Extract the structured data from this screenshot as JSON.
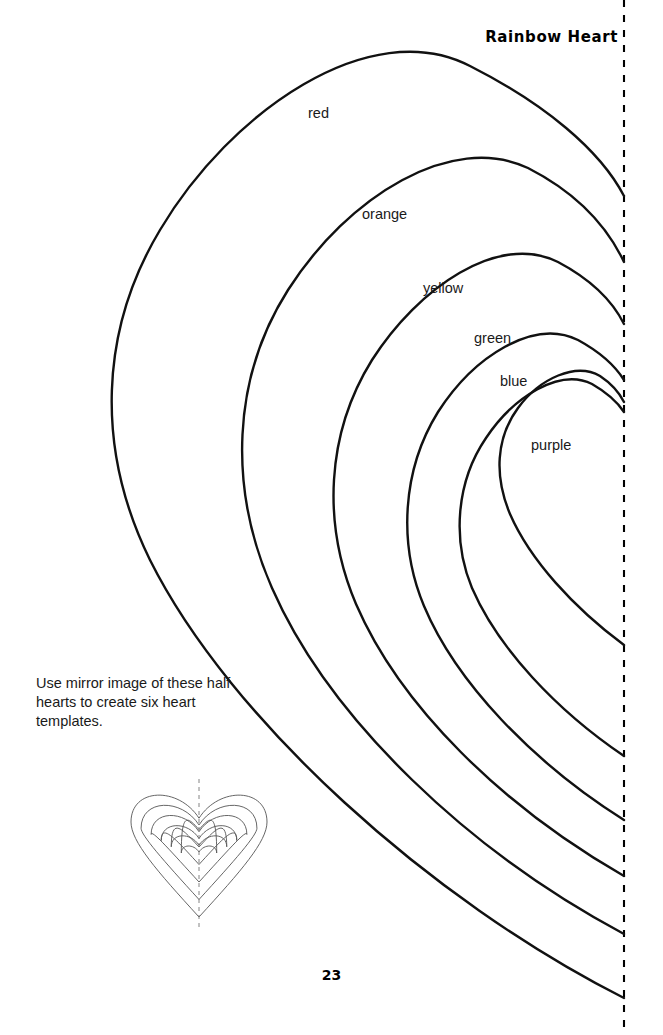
{
  "page": {
    "title": "Rainbow Heart",
    "page_number": "23",
    "note": "Use mirror image of these half hearts to create six heart templates.",
    "fold_line": "dashed vertical center fold line"
  },
  "bands": [
    {
      "id": "red",
      "label": "red",
      "label_x": 308,
      "label_y": 105
    },
    {
      "id": "orange",
      "label": "orange",
      "label_x": 362,
      "label_y": 206
    },
    {
      "id": "yellow",
      "label": "yellow",
      "label_x": 423,
      "label_y": 280
    },
    {
      "id": "green",
      "label": "green",
      "label_x": 474,
      "label_y": 330
    },
    {
      "id": "blue",
      "label": "blue",
      "label_x": 500,
      "label_y": 373
    },
    {
      "id": "purple",
      "label": "purple",
      "label_x": 531,
      "label_y": 437
    }
  ],
  "chart_data": {
    "type": "line",
    "xlabel": "",
    "ylabel": "",
    "xlim": [
      0,
      663
    ],
    "ylim": [
      0,
      1035
    ],
    "grid": false,
    "legend": "inline labels inside each band",
    "fold_line_x": 624,
    "series": [
      {
        "name": "red",
        "path": "M 624 998 C 430 900 230 720 150 560 C 95 448 100 330 160 230 C 230 112 370 14 470 66 C 545 104 600 150 624 196",
        "leftmost_x": 112,
        "top_y": 35,
        "fold_top_y": 196,
        "fold_bottom_y": 998
      },
      {
        "name": "orange",
        "path": "M 624 934 C 470 852 330 720 272 588 C 228 488 232 378 288 290 C 348 196 452 132 528 168 C 575 192 606 224 624 262",
        "leftmost_x": 232,
        "top_y": 155,
        "fold_top_y": 262,
        "fold_bottom_y": 934
      },
      {
        "name": "yellow",
        "path": "M 624 876 C 502 806 400 706 356 604 C 322 524 326 434 372 360 C 418 288 498 232 558 262 C 592 280 612 300 624 324",
        "leftmost_x": 326,
        "top_y": 238,
        "fold_top_y": 324,
        "fold_bottom_y": 876
      },
      {
        "name": "green",
        "path": "M 624 820 C 532 762 456 682 424 606 C 398 544 402 470 438 412 C 474 356 534 318 578 340 C 600 352 614 364 624 380",
        "leftmost_x": 400,
        "top_y": 302,
        "fold_top_y": 380,
        "fold_bottom_y": 820
      },
      {
        "name": "blue",
        "path": "M 624 756 C 556 710 498 648 472 588 C 452 540 456 482 486 438 C 514 396 560 368 592 384 C 606 392 616 400 624 412",
        "leftmost_x": 454,
        "top_y": 340,
        "fold_top_y": 412,
        "fold_bottom_y": 756
      },
      {
        "name": "purple",
        "path": "M 624 645 C 574 608 530 560 510 514 C 494 476 496 438 518 408 C 540 378 576 362 600 376 C 612 384 619 392 624 402",
        "leftmost_x": 492,
        "top_y": 366,
        "fold_top_y": 402,
        "fold_bottom_y": 645
      }
    ]
  },
  "thumbnail": {
    "name": "six-nested-hearts-preview",
    "heart_count": 6,
    "has_center_fold_line": true
  }
}
